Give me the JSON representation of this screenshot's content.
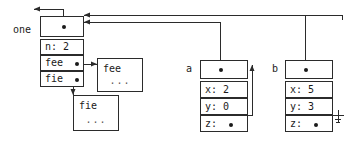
{
  "diagram": {
    "line_color": "#2b2b2b",
    "text_color": "#1a1a1a",
    "background": "#ffffff"
  },
  "nodes": {
    "one": {
      "label": "one",
      "pointer_cell": "",
      "fields": [
        {
          "name": "n",
          "text": "n: 2"
        },
        {
          "name": "fee",
          "text": "fee"
        },
        {
          "name": "fie",
          "text": "fie"
        }
      ]
    },
    "fee_obj": {
      "name": "fee",
      "dots": "..."
    },
    "fie_obj": {
      "name": "fie",
      "dots": "..."
    },
    "a": {
      "label": "a",
      "fields": [
        {
          "name": "x",
          "text": "x: 2"
        },
        {
          "name": "y",
          "text": "y: 0"
        },
        {
          "name": "z",
          "text": "z:"
        }
      ]
    },
    "b": {
      "label": "b",
      "fields": [
        {
          "name": "x",
          "text": "x: 5"
        },
        {
          "name": "y",
          "text": "y: 3"
        },
        {
          "name": "z",
          "text": "z:"
        }
      ]
    }
  },
  "symbols": {
    "ground": "ground-symbol"
  }
}
